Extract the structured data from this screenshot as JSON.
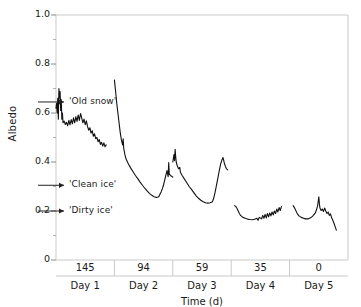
{
  "chart_data": {
    "type": "line",
    "title": "",
    "xlabel": "Time (d)",
    "ylabel": "Albedo",
    "ylim": [
      0,
      1.0
    ],
    "yticks": [
      "0",
      "0.2",
      "0.4",
      "0.6",
      "0.8",
      "1.0"
    ],
    "ytick_values": [
      0,
      0.2,
      0.4,
      0.6,
      0.8,
      1.0
    ],
    "minor_ticks": true,
    "grid": false,
    "legend": "none",
    "panels": [
      {
        "day_label": "Day 1",
        "value_label": "145"
      },
      {
        "day_label": "Day 2",
        "value_label": "94"
      },
      {
        "day_label": "Day 3",
        "value_label": "59"
      },
      {
        "day_label": "Day 4",
        "value_label": "35"
      },
      {
        "day_label": "Day 5",
        "value_label": "0"
      }
    ],
    "annotations": [
      {
        "text": "'Old snow'",
        "y_value": 0.645,
        "arrow": "right"
      },
      {
        "text": "'Clean ice'",
        "y_value": 0.305,
        "arrow": "right"
      },
      {
        "text": "'Dirty ice'",
        "y_value": 0.2,
        "arrow": "right"
      }
    ],
    "series": [
      {
        "name": "Day 1 albedo",
        "panel": 0,
        "points": [
          [
            0.0,
            0.62
          ],
          [
            0.01,
            0.64
          ],
          [
            0.02,
            0.6
          ],
          [
            0.03,
            0.66
          ],
          [
            0.04,
            0.575
          ],
          [
            0.05,
            0.7
          ],
          [
            0.06,
            0.66
          ],
          [
            0.07,
            0.688
          ],
          [
            0.08,
            0.61
          ],
          [
            0.09,
            0.655
          ],
          [
            0.1,
            0.575
          ],
          [
            0.11,
            0.6
          ],
          [
            0.12,
            0.56
          ],
          [
            0.14,
            0.567
          ],
          [
            0.16,
            0.553
          ],
          [
            0.18,
            0.562
          ],
          [
            0.2,
            0.548
          ],
          [
            0.22,
            0.57
          ],
          [
            0.24,
            0.552
          ],
          [
            0.26,
            0.573
          ],
          [
            0.28,
            0.556
          ],
          [
            0.3,
            0.58
          ],
          [
            0.32,
            0.56
          ],
          [
            0.34,
            0.585
          ],
          [
            0.36,
            0.566
          ],
          [
            0.38,
            0.592
          ],
          [
            0.4,
            0.57
          ],
          [
            0.42,
            0.598
          ],
          [
            0.44,
            0.58
          ],
          [
            0.46,
            0.56
          ],
          [
            0.48,
            0.575
          ],
          [
            0.5,
            0.552
          ],
          [
            0.52,
            0.568
          ],
          [
            0.54,
            0.545
          ],
          [
            0.56,
            0.53
          ],
          [
            0.58,
            0.54
          ],
          [
            0.6,
            0.518
          ],
          [
            0.62,
            0.528
          ],
          [
            0.64,
            0.505
          ],
          [
            0.66,
            0.515
          ],
          [
            0.68,
            0.495
          ],
          [
            0.7,
            0.5
          ],
          [
            0.72,
            0.483
          ],
          [
            0.74,
            0.492
          ],
          [
            0.76,
            0.472
          ],
          [
            0.78,
            0.48
          ],
          [
            0.8,
            0.465
          ],
          [
            0.82,
            0.478
          ],
          [
            0.84,
            0.462
          ],
          [
            0.86,
            0.47
          ]
        ]
      },
      {
        "name": "Day 2 albedo",
        "panel": 1,
        "points": [
          [
            0.0,
            0.735
          ],
          [
            0.02,
            0.69
          ],
          [
            0.04,
            0.64
          ],
          [
            0.06,
            0.6
          ],
          [
            0.08,
            0.56
          ],
          [
            0.1,
            0.52
          ],
          [
            0.12,
            0.49
          ],
          [
            0.14,
            0.47
          ],
          [
            0.15,
            0.495
          ],
          [
            0.16,
            0.455
          ],
          [
            0.18,
            0.43
          ],
          [
            0.2,
            0.412
          ],
          [
            0.24,
            0.392
          ],
          [
            0.28,
            0.375
          ],
          [
            0.32,
            0.36
          ],
          [
            0.36,
            0.345
          ],
          [
            0.4,
            0.332
          ],
          [
            0.44,
            0.318
          ],
          [
            0.48,
            0.305
          ],
          [
            0.52,
            0.293
          ],
          [
            0.56,
            0.282
          ],
          [
            0.6,
            0.272
          ],
          [
            0.64,
            0.264
          ],
          [
            0.68,
            0.258
          ],
          [
            0.72,
            0.255
          ],
          [
            0.76,
            0.258
          ],
          [
            0.78,
            0.268
          ],
          [
            0.8,
            0.278
          ],
          [
            0.82,
            0.29
          ],
          [
            0.84,
            0.305
          ],
          [
            0.86,
            0.325
          ],
          [
            0.88,
            0.345
          ],
          [
            0.9,
            0.365
          ],
          [
            0.92,
            0.34
          ],
          [
            0.93,
            0.398
          ],
          [
            0.94,
            0.35
          ],
          [
            0.96,
            0.345
          ],
          [
            0.98,
            0.342
          ],
          [
            1.0,
            0.338
          ]
        ]
      },
      {
        "name": "Day 3 albedo",
        "panel": 2,
        "points": [
          [
            0.0,
            0.4
          ],
          [
            0.02,
            0.43
          ],
          [
            0.03,
            0.405
          ],
          [
            0.04,
            0.452
          ],
          [
            0.05,
            0.42
          ],
          [
            0.06,
            0.398
          ],
          [
            0.08,
            0.382
          ],
          [
            0.1,
            0.372
          ],
          [
            0.12,
            0.378
          ],
          [
            0.13,
            0.358
          ],
          [
            0.16,
            0.345
          ],
          [
            0.2,
            0.33
          ],
          [
            0.24,
            0.315
          ],
          [
            0.28,
            0.3
          ],
          [
            0.32,
            0.288
          ],
          [
            0.36,
            0.275
          ],
          [
            0.4,
            0.262
          ],
          [
            0.44,
            0.252
          ],
          [
            0.48,
            0.244
          ],
          [
            0.52,
            0.238
          ],
          [
            0.56,
            0.234
          ],
          [
            0.6,
            0.232
          ],
          [
            0.64,
            0.234
          ],
          [
            0.68,
            0.238
          ],
          [
            0.7,
            0.252
          ],
          [
            0.72,
            0.272
          ],
          [
            0.74,
            0.295
          ],
          [
            0.76,
            0.32
          ],
          [
            0.78,
            0.345
          ],
          [
            0.8,
            0.37
          ],
          [
            0.82,
            0.392
          ],
          [
            0.84,
            0.408
          ],
          [
            0.86,
            0.418
          ],
          [
            0.88,
            0.398
          ],
          [
            0.9,
            0.382
          ],
          [
            0.92,
            0.372
          ],
          [
            0.94,
            0.368
          ]
        ]
      },
      {
        "name": "Day 4 albedo",
        "panel": 3,
        "points": [
          [
            0.06,
            0.222
          ],
          [
            0.08,
            0.218
          ],
          [
            0.1,
            0.21
          ],
          [
            0.12,
            0.2
          ],
          [
            0.14,
            0.19
          ],
          [
            0.16,
            0.182
          ],
          [
            0.2,
            0.174
          ],
          [
            0.24,
            0.17
          ],
          [
            0.28,
            0.167
          ],
          [
            0.32,
            0.165
          ],
          [
            0.36,
            0.164
          ],
          [
            0.4,
            0.166
          ],
          [
            0.44,
            0.17
          ],
          [
            0.46,
            0.162
          ],
          [
            0.48,
            0.174
          ],
          [
            0.52,
            0.168
          ],
          [
            0.54,
            0.182
          ],
          [
            0.56,
            0.17
          ],
          [
            0.58,
            0.186
          ],
          [
            0.6,
            0.172
          ],
          [
            0.62,
            0.19
          ],
          [
            0.64,
            0.176
          ],
          [
            0.66,
            0.192
          ],
          [
            0.68,
            0.18
          ],
          [
            0.7,
            0.196
          ],
          [
            0.72,
            0.184
          ],
          [
            0.74,
            0.2
          ],
          [
            0.76,
            0.19
          ],
          [
            0.78,
            0.208
          ],
          [
            0.8,
            0.196
          ],
          [
            0.82,
            0.214
          ],
          [
            0.84,
            0.202
          ],
          [
            0.86,
            0.218
          ]
        ]
      },
      {
        "name": "Day 5 albedo",
        "panel": 4,
        "points": [
          [
            0.06,
            0.222
          ],
          [
            0.08,
            0.215
          ],
          [
            0.1,
            0.205
          ],
          [
            0.12,
            0.195
          ],
          [
            0.14,
            0.186
          ],
          [
            0.16,
            0.18
          ],
          [
            0.2,
            0.174
          ],
          [
            0.24,
            0.17
          ],
          [
            0.28,
            0.168
          ],
          [
            0.32,
            0.168
          ],
          [
            0.36,
            0.172
          ],
          [
            0.4,
            0.18
          ],
          [
            0.44,
            0.192
          ],
          [
            0.46,
            0.205
          ],
          [
            0.48,
            0.222
          ],
          [
            0.49,
            0.24
          ],
          [
            0.5,
            0.258
          ],
          [
            0.51,
            0.23
          ],
          [
            0.52,
            0.212
          ],
          [
            0.54,
            0.202
          ],
          [
            0.56,
            0.208
          ],
          [
            0.58,
            0.198
          ],
          [
            0.6,
            0.212
          ],
          [
            0.62,
            0.2
          ],
          [
            0.64,
            0.19
          ],
          [
            0.66,
            0.196
          ],
          [
            0.68,
            0.182
          ],
          [
            0.7,
            0.188
          ],
          [
            0.72,
            0.172
          ],
          [
            0.74,
            0.162
          ],
          [
            0.76,
            0.15
          ],
          [
            0.78,
            0.136
          ],
          [
            0.8,
            0.122
          ]
        ]
      }
    ]
  }
}
